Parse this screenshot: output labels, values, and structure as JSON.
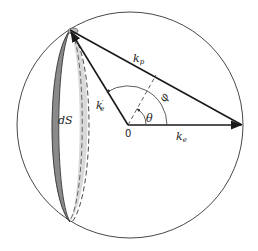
{
  "diagram": {
    "type": "momentum-sphere",
    "labels": {
      "k_p": {
        "base": "k",
        "sub": "p"
      },
      "k_e_prime": {
        "base": "k",
        "sub": "e",
        "sup": "′"
      },
      "k_e": {
        "base": "k",
        "sub": "e"
      },
      "theta": "θ",
      "phi": "φ",
      "origin": "0",
      "surface_element": "dS"
    },
    "colors": {
      "outline": "#333333",
      "vector": "#1a1a1a",
      "band_dark": "#8a8a8a",
      "band_light": "#d9d9d9"
    }
  }
}
